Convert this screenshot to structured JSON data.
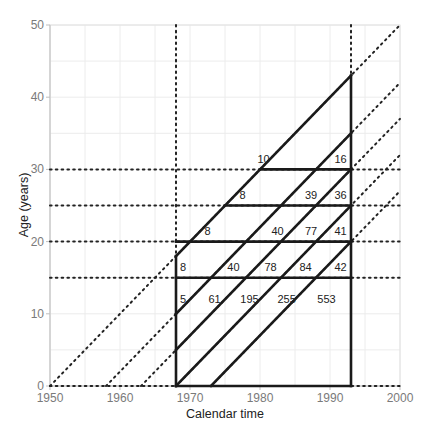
{
  "chart_data": {
    "type": "line",
    "title": "",
    "xlabel": "Calendar time",
    "ylabel": "Age (years)",
    "xlim": [
      1950,
      2000
    ],
    "ylim": [
      0,
      50
    ],
    "x_ticks": [
      1950,
      1960,
      1970,
      1980,
      1990,
      2000
    ],
    "y_ticks": [
      0,
      10,
      20,
      30,
      40,
      50
    ],
    "grid": true,
    "minor_grid_step": 5,
    "dotted_verticals": [
      1968,
      1993
    ],
    "dotted_horizontals": [
      0,
      15,
      20,
      25,
      30
    ],
    "dotted_cohort_diagonals": [
      1950,
      1958,
      1963,
      1968,
      1973
    ],
    "observation_window": {
      "start": 1968,
      "end": 1993
    },
    "solid_frame": {
      "left_x": 1968,
      "right_x": 1993,
      "bottom_y": 0,
      "left_top_y": 18,
      "right_top_y": 43
    },
    "solid_horizontals": [
      {
        "y": 15,
        "x0": 1968,
        "x1": 1993
      },
      {
        "y": 20,
        "x0": 1968,
        "x1": 1993
      },
      {
        "y": 25,
        "x0": 1975,
        "x1": 1993
      },
      {
        "y": 30,
        "x0": 1980,
        "x1": 1993
      }
    ],
    "solid_cohort_diagonals": [
      {
        "birth": 1950,
        "x0": 1968,
        "x1": 1993
      },
      {
        "birth": 1958,
        "x0": 1968,
        "x1": 1993
      },
      {
        "birth": 1963,
        "x0": 1968,
        "x1": 1993
      },
      {
        "birth": 1968,
        "x0": 1968,
        "x1": 1993
      },
      {
        "birth": 1973,
        "x0": 1973,
        "x1": 1993
      }
    ],
    "cell_counts": [
      {
        "x": 1980.5,
        "y": 31.5,
        "value": "10"
      },
      {
        "x": 1991.5,
        "y": 31.5,
        "value": "16"
      },
      {
        "x": 1977.5,
        "y": 26.5,
        "value": "8"
      },
      {
        "x": 1987.3,
        "y": 26.5,
        "value": "39"
      },
      {
        "x": 1991.5,
        "y": 26.5,
        "value": "36"
      },
      {
        "x": 1972.5,
        "y": 21.5,
        "value": "8"
      },
      {
        "x": 1982.5,
        "y": 21.5,
        "value": "40"
      },
      {
        "x": 1987.3,
        "y": 21.5,
        "value": "77"
      },
      {
        "x": 1991.5,
        "y": 21.5,
        "value": "41"
      },
      {
        "x": 1969.0,
        "y": 16.5,
        "value": "8"
      },
      {
        "x": 1976.2,
        "y": 16.5,
        "value": "40"
      },
      {
        "x": 1981.5,
        "y": 16.5,
        "value": "78"
      },
      {
        "x": 1986.5,
        "y": 16.5,
        "value": "84"
      },
      {
        "x": 1991.5,
        "y": 16.5,
        "value": "42"
      },
      {
        "x": 1969.0,
        "y": 12.0,
        "value": "5"
      },
      {
        "x": 1973.5,
        "y": 12.0,
        "value": "61"
      },
      {
        "x": 1978.5,
        "y": 12.0,
        "value": "195"
      },
      {
        "x": 1983.8,
        "y": 12.0,
        "value": "255"
      },
      {
        "x": 1989.5,
        "y": 12.0,
        "value": "553"
      }
    ]
  },
  "colors": {
    "solid_line": "#1a1a1a",
    "dotted_line": "#222222",
    "grid": "#ececec",
    "axis": "#bfbfbf",
    "tick_text": "#7a7a7a"
  }
}
